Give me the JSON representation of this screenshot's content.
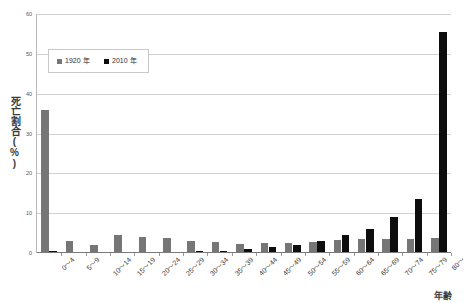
{
  "chart_data": {
    "type": "bar",
    "title": "",
    "xlabel": "年齢",
    "ylabel": "死亡割合(%)",
    "ylim": [
      0,
      60
    ],
    "ytick_values": [
      0,
      10,
      20,
      30,
      40,
      50,
      60
    ],
    "ytick_labels": [
      "0",
      "10",
      "20",
      "30",
      "40",
      "50",
      "60"
    ],
    "grid": true,
    "legend_position": "upper-left-inside",
    "categories": [
      "0〜4",
      "5〜9",
      "10〜14",
      "15〜19",
      "20〜24",
      "25〜29",
      "30〜34",
      "35〜39",
      "40〜44",
      "45〜49",
      "50〜54",
      "55〜59",
      "60〜64",
      "65〜69",
      "70〜74",
      "75〜79",
      "80〜"
    ],
    "series": [
      {
        "name": "1920 年",
        "color": "#767676",
        "values": [
          35.8,
          3.1,
          1.9,
          4.5,
          4.1,
          3.7,
          3.0,
          2.7,
          2.2,
          2.6,
          2.4,
          2.8,
          3.2,
          3.4,
          3.6,
          3.4,
          3.8
        ]
      },
      {
        "name": "2010 年",
        "color": "#0d0d0d",
        "values": [
          0.4,
          0.1,
          0.1,
          0.2,
          0.3,
          0.3,
          0.4,
          0.6,
          0.9,
          1.4,
          2.1,
          3.1,
          4.4,
          6.1,
          9.0,
          13.5,
          55.6
        ]
      }
    ]
  },
  "legend": {
    "entries": [
      {
        "label": "1920 年",
        "swatch": "legend-swatch-1920"
      },
      {
        "label": "2010 年",
        "swatch": "legend-swatch-2010"
      }
    ]
  },
  "colors": {
    "series_1920": "#767676",
    "series_2010": "#0d0d0d",
    "gridline": "#d0d0d0",
    "axis": "#7a7a7a",
    "background": "#ffffff"
  }
}
